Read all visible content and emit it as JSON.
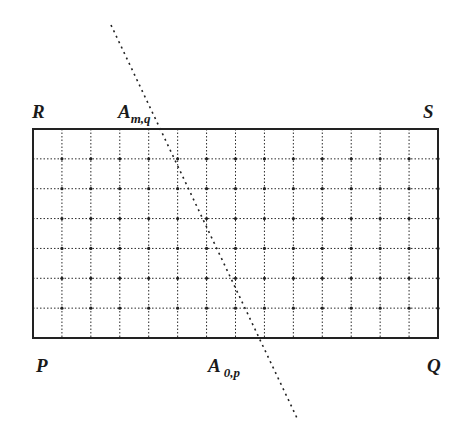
{
  "diagram": {
    "labels": {
      "R": "R",
      "S": "S",
      "P": "P",
      "Q": "Q",
      "A_top_main": "A",
      "A_top_sub": "m,q",
      "A_bottom_main": "A",
      "A_bottom_sub": "0,p"
    },
    "grid": {
      "columns": 14,
      "rows": 7,
      "left": 33,
      "right": 438,
      "top": 129,
      "bottom": 338,
      "line_color": "#2a2a2a"
    },
    "cutting_line": {
      "start": [
        111,
        25
      ],
      "end": [
        297,
        418
      ],
      "style": "dotted"
    }
  }
}
